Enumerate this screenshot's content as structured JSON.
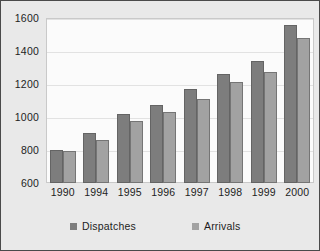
{
  "chart_data": {
    "type": "bar",
    "title": "",
    "subtitle": "",
    "xlabel": "",
    "ylabel": "",
    "ylim": [
      600,
      1600
    ],
    "ytick_step": 200,
    "yticks": [
      1600,
      1400,
      1200,
      1000,
      800,
      600
    ],
    "grid": true,
    "legend_position": "bottom",
    "categories": [
      "1990",
      "1994",
      "1995",
      "1996",
      "1997",
      "1998",
      "1999",
      "2000"
    ],
    "series": [
      {
        "name": "Dispatches",
        "color": "#7d7d7d",
        "values": [
          800,
          905,
          1020,
          1070,
          1170,
          1260,
          1340,
          1555
        ]
      },
      {
        "name": "Arrivals",
        "color": "#a2a2a2",
        "values": [
          795,
          860,
          975,
          1030,
          1110,
          1215,
          1275,
          1480
        ]
      }
    ]
  },
  "legend": {
    "entries": [
      {
        "label": "Dispatches",
        "swatch": "dispatches-swatch"
      },
      {
        "label": "Arrivals",
        "swatch": "arrivals-swatch"
      }
    ]
  },
  "colors": {
    "frame_background": "#e9e9e9",
    "plot_background": "#fbfbfb",
    "frame_border": "#4a4a4a",
    "gridline": "#e2e2e2",
    "text": "#1d1d1d"
  }
}
